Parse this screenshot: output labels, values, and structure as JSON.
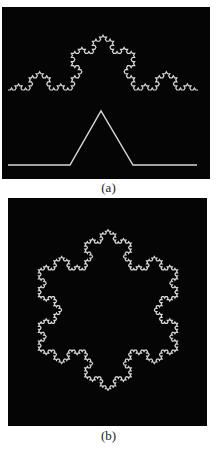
{
  "figure": {
    "panels": [
      {
        "id": "a",
        "caption": "(a)",
        "description": "Koch curve (iteration 4) with its generator shown below",
        "background": "#050505",
        "stroke": "#d8d8d8",
        "koch_curve": {
          "iterations": 4,
          "start": [
            6,
            83
          ],
          "end": [
            196,
            83
          ]
        },
        "generator": {
          "points": [
            [
              6,
              158
            ],
            [
              68,
              158
            ],
            [
              99,
              104
            ],
            [
              131,
              158
            ],
            [
              195,
              158
            ]
          ]
        }
      },
      {
        "id": "b",
        "caption": "(b)",
        "description": "Koch snowflake (iteration 4)",
        "background": "#050505",
        "stroke": "#d8d8d8",
        "koch_snowflake": {
          "iterations": 4,
          "center": [
            100,
            112
          ],
          "tip_radius": 107
        }
      }
    ]
  }
}
